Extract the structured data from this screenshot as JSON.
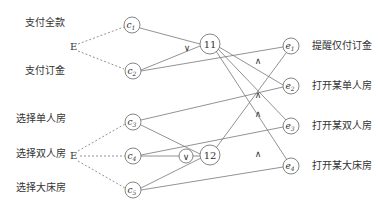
{
  "left_labels": [
    "支付全款",
    "支付订金",
    "选择单人房",
    "选择双人房",
    "选择大床房"
  ],
  "right_labels": [
    "提醒仅付订金",
    "打开某单人房",
    "打开某双人房",
    "打开某大床房"
  ],
  "event_label": "E",
  "cause_nodes": [
    "c1",
    "c2",
    "c3",
    "c4",
    "c5"
  ],
  "intermediate_nodes": [
    "11",
    "12"
  ],
  "effect_nodes": [
    "e1",
    "e2",
    "e3",
    "e4"
  ],
  "or_symbol": "∨",
  "and_symbol": "∧",
  "colors": {
    "line": "#666666",
    "text": "#333333"
  }
}
